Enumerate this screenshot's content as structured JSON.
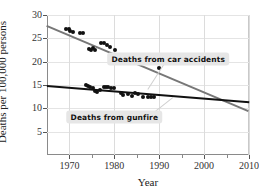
{
  "chart_data": {
    "type": "scatter",
    "title": "",
    "xlabel": "Year",
    "ylabel": "Deaths per 100,000 persons",
    "xlim": [
      1965,
      2010
    ],
    "ylim": [
      0,
      30
    ],
    "xticks": [
      1970,
      1980,
      1990,
      2000,
      2010
    ],
    "xticks_minor": [
      1975,
      1985,
      1995,
      2005
    ],
    "yticks": [
      5,
      10,
      15,
      20,
      25,
      30
    ],
    "grid": "both-light",
    "legend": "inline-annotations",
    "annotations": [
      {
        "name": "car-accidents-label",
        "text": "Deaths from car accidents",
        "x": 1992,
        "y": 20.6
      },
      {
        "name": "gunfire-label",
        "text": "Deaths from gunfire",
        "x": 1980,
        "y": 8.2
      }
    ],
    "series": [
      {
        "name": "Deaths from car accidents",
        "color": "#111111",
        "trend_color": "#777777",
        "trend": {
          "x1": 1965,
          "y1": 27.9,
          "x2": 2010,
          "y2": 9.6
        },
        "points": [
          {
            "x": 1969.3,
            "y": 27.0
          },
          {
            "x": 1969.8,
            "y": 26.9
          },
          {
            "x": 1970.2,
            "y": 26.5
          },
          {
            "x": 1970.7,
            "y": 26.3
          },
          {
            "x": 1972.3,
            "y": 26.2
          },
          {
            "x": 1973.0,
            "y": 26.1
          },
          {
            "x": 1974.4,
            "y": 22.8
          },
          {
            "x": 1974.8,
            "y": 22.6
          },
          {
            "x": 1975.3,
            "y": 23.0
          },
          {
            "x": 1975.6,
            "y": 22.5
          },
          {
            "x": 1977.0,
            "y": 24.1
          },
          {
            "x": 1977.6,
            "y": 24.0
          },
          {
            "x": 1978.4,
            "y": 23.6
          },
          {
            "x": 1979.0,
            "y": 23.1
          },
          {
            "x": 1980.1,
            "y": 22.5
          },
          {
            "x": 1981.0,
            "y": 21.4
          },
          {
            "x": 1981.6,
            "y": 20.3
          },
          {
            "x": 1982.1,
            "y": 20.1
          },
          {
            "x": 1982.6,
            "y": 20.2
          },
          {
            "x": 1983.4,
            "y": 20.7
          },
          {
            "x": 1984.0,
            "y": 20.6
          },
          {
            "x": 1984.8,
            "y": 20.8
          },
          {
            "x": 1985.4,
            "y": 20.4
          },
          {
            "x": 1986.0,
            "y": 20.6
          },
          {
            "x": 1986.6,
            "y": 20.3
          },
          {
            "x": 1987.4,
            "y": 19.8
          },
          {
            "x": 1990.0,
            "y": 18.6
          }
        ]
      },
      {
        "name": "Deaths from gunfire",
        "color": "#111111",
        "trend_color": "#111111",
        "trend": {
          "x1": 1965,
          "y1": 15.0,
          "x2": 2010,
          "y2": 11.5
        },
        "points": [
          {
            "x": 1973.6,
            "y": 14.9
          },
          {
            "x": 1974.1,
            "y": 14.8
          },
          {
            "x": 1974.6,
            "y": 14.6
          },
          {
            "x": 1975.2,
            "y": 14.3
          },
          {
            "x": 1975.8,
            "y": 13.7
          },
          {
            "x": 1976.2,
            "y": 13.6
          },
          {
            "x": 1976.8,
            "y": 14.0
          },
          {
            "x": 1977.6,
            "y": 14.6
          },
          {
            "x": 1978.1,
            "y": 14.5
          },
          {
            "x": 1978.6,
            "y": 14.5
          },
          {
            "x": 1979.2,
            "y": 14.3
          },
          {
            "x": 1980.0,
            "y": 14.4
          },
          {
            "x": 1981.4,
            "y": 13.3
          },
          {
            "x": 1982.0,
            "y": 12.8
          },
          {
            "x": 1983.0,
            "y": 13.0
          },
          {
            "x": 1984.0,
            "y": 12.7
          },
          {
            "x": 1984.6,
            "y": 13.2
          },
          {
            "x": 1985.2,
            "y": 13.0
          },
          {
            "x": 1986.4,
            "y": 12.4
          },
          {
            "x": 1987.6,
            "y": 12.5
          },
          {
            "x": 1988.2,
            "y": 12.5
          },
          {
            "x": 1988.8,
            "y": 12.4
          }
        ]
      }
    ]
  }
}
